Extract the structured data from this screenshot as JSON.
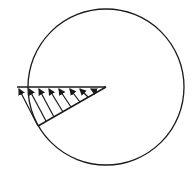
{
  "diagram": {
    "type": "physics-distribution-diagram",
    "colors": {
      "stroke": "#1a1a1a",
      "background": "#ffffff"
    },
    "circle": {
      "cx": 106,
      "cy": 87,
      "r": 78
    },
    "horizontal_line": {
      "x1": 17,
      "y1": 87,
      "x2": 106,
      "y2": 87
    },
    "inclined_line": {
      "x1": 106,
      "y1": 87,
      "x2": 38,
      "y2": 126
    },
    "arrows": [
      {
        "from": [
          38,
          126
        ],
        "to": [
          19,
          89
        ]
      },
      {
        "from": [
          46,
          121
        ],
        "to": [
          29,
          89
        ]
      },
      {
        "from": [
          54,
          117
        ],
        "to": [
          39,
          89
        ]
      },
      {
        "from": [
          63,
          112
        ],
        "to": [
          49,
          89
        ]
      },
      {
        "from": [
          71,
          107
        ],
        "to": [
          59,
          89
        ]
      },
      {
        "from": [
          80,
          102
        ],
        "to": [
          70,
          89
        ]
      },
      {
        "from": [
          88,
          97
        ],
        "to": [
          80,
          89
        ]
      },
      {
        "from": [
          97,
          92
        ],
        "to": [
          91,
          89
        ]
      }
    ]
  }
}
